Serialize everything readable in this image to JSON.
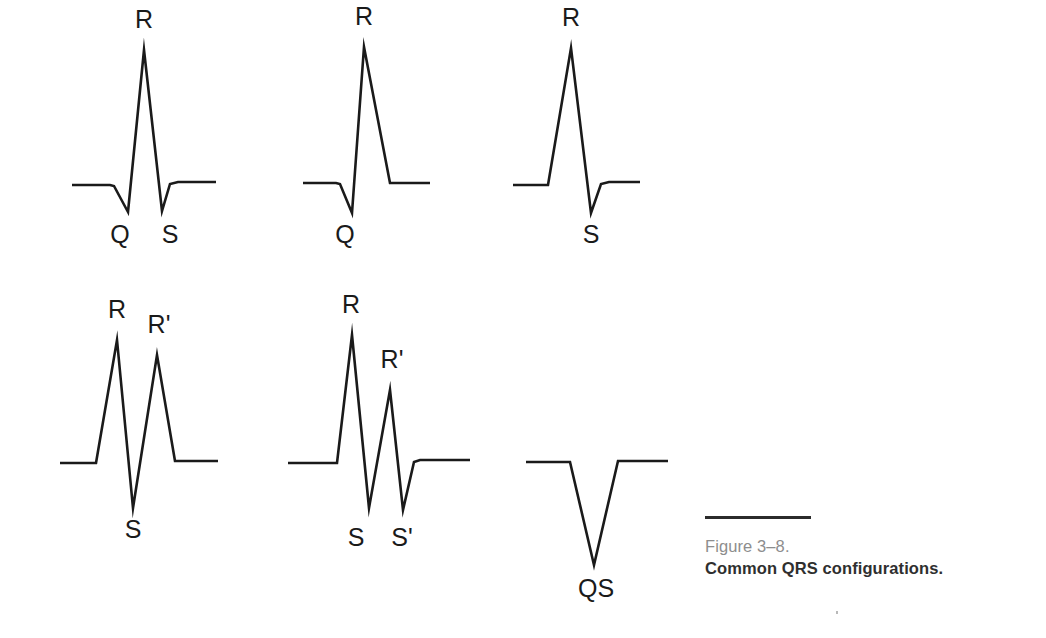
{
  "figure": {
    "number": "Figure 3–8.",
    "title": "Common QRS configurations.",
    "stroke_color": "#1a1a1a",
    "label_color": "#1a1a1a",
    "number_color": "#8d8d8d",
    "title_color": "#2f2f2f",
    "background_color": "#ffffff",
    "width": 1046,
    "height": 638
  },
  "chart_data": {
    "type": "line",
    "title": "Common QRS configurations.",
    "xlabel": "",
    "ylabel": "",
    "grid": false,
    "legend": "none",
    "series": [
      {
        "name": "qRs",
        "row": 1,
        "column": 1,
        "baseline_y": 185,
        "points": [
          [
            72,
            185
          ],
          [
            110,
            185
          ],
          [
            114,
            186
          ],
          [
            128,
            212
          ],
          [
            144,
            50
          ],
          [
            162,
            211
          ],
          [
            170,
            184
          ],
          [
            178,
            182
          ],
          [
            216,
            182
          ]
        ],
        "deflections": [
          {
            "label": "Q",
            "polarity": "negative",
            "apex": [
              128,
              212
            ]
          },
          {
            "label": "R",
            "polarity": "positive",
            "apex": [
              144,
              50
            ]
          },
          {
            "label": "S",
            "polarity": "negative",
            "apex": [
              162,
              211
            ]
          }
        ]
      },
      {
        "name": "qR",
        "row": 1,
        "column": 2,
        "baseline_y": 185,
        "points": [
          [
            303,
            183
          ],
          [
            336,
            183
          ],
          [
            340,
            184
          ],
          [
            352,
            213
          ],
          [
            364,
            47
          ],
          [
            390,
            183
          ],
          [
            430,
            183
          ]
        ],
        "deflections": [
          {
            "label": "Q",
            "polarity": "negative",
            "apex": [
              352,
              213
            ]
          },
          {
            "label": "R",
            "polarity": "positive",
            "apex": [
              364,
              47
            ]
          }
        ]
      },
      {
        "name": "Rs",
        "row": 1,
        "column": 3,
        "baseline_y": 185,
        "points": [
          [
            513,
            185
          ],
          [
            548,
            185
          ],
          [
            571,
            48
          ],
          [
            591,
            213
          ],
          [
            601,
            184
          ],
          [
            609,
            182
          ],
          [
            640,
            182
          ]
        ],
        "deflections": [
          {
            "label": "R",
            "polarity": "positive",
            "apex": [
              571,
              48
            ]
          },
          {
            "label": "S",
            "polarity": "negative",
            "apex": [
              591,
              213
            ]
          }
        ]
      },
      {
        "name": "RSR'",
        "row": 2,
        "column": 1,
        "baseline_y": 462,
        "points": [
          [
            60,
            463
          ],
          [
            96,
            463
          ],
          [
            117,
            340
          ],
          [
            133,
            508
          ],
          [
            157,
            355
          ],
          [
            175,
            461
          ],
          [
            218,
            461
          ]
        ],
        "deflections": [
          {
            "label": "R",
            "polarity": "positive",
            "apex": [
              117,
              340
            ]
          },
          {
            "label": "S",
            "polarity": "negative",
            "apex": [
              133,
              508
            ]
          },
          {
            "label": "R'",
            "polarity": "positive",
            "apex": [
              157,
              355
            ]
          }
        ]
      },
      {
        "name": "RSR'S'",
        "row": 2,
        "column": 2,
        "baseline_y": 462,
        "points": [
          [
            288,
            463
          ],
          [
            337,
            463
          ],
          [
            352,
            335
          ],
          [
            369,
            508
          ],
          [
            390,
            390
          ],
          [
            403,
            510
          ],
          [
            414,
            462
          ],
          [
            420,
            460
          ],
          [
            470,
            460
          ]
        ],
        "deflections": [
          {
            "label": "R",
            "polarity": "positive",
            "apex": [
              352,
              335
            ]
          },
          {
            "label": "S",
            "polarity": "negative",
            "apex": [
              369,
              508
            ]
          },
          {
            "label": "R'",
            "polarity": "positive",
            "apex": [
              390,
              390
            ]
          },
          {
            "label": "S'",
            "polarity": "negative",
            "apex": [
              403,
              510
            ]
          }
        ]
      },
      {
        "name": "QS",
        "row": 2,
        "column": 3,
        "baseline_y": 462,
        "points": [
          [
            526,
            462
          ],
          [
            570,
            462
          ],
          [
            594,
            565
          ],
          [
            618,
            461
          ],
          [
            668,
            461
          ]
        ],
        "deflections": [
          {
            "label": "QS",
            "polarity": "negative",
            "apex": [
              594,
              565
            ]
          }
        ]
      }
    ],
    "annotations": [
      {
        "text": "R",
        "x": 144,
        "y": 28,
        "complex": "qRs"
      },
      {
        "text": "Q",
        "x": 120,
        "y": 243,
        "complex": "qRs"
      },
      {
        "text": "S",
        "x": 170,
        "y": 243,
        "complex": "qRs"
      },
      {
        "text": "R",
        "x": 364,
        "y": 25,
        "complex": "qR"
      },
      {
        "text": "Q",
        "x": 345,
        "y": 243,
        "complex": "qR"
      },
      {
        "text": "R",
        "x": 571,
        "y": 26,
        "complex": "Rs"
      },
      {
        "text": "S",
        "x": 591,
        "y": 243,
        "complex": "Rs"
      },
      {
        "text": "R",
        "x": 117,
        "y": 318,
        "complex": "RSR'"
      },
      {
        "text": "R'",
        "x": 159,
        "y": 333,
        "complex": "RSR'"
      },
      {
        "text": "S",
        "x": 133,
        "y": 538,
        "complex": "RSR'"
      },
      {
        "text": "R",
        "x": 351,
        "y": 313,
        "complex": "RSR'S'"
      },
      {
        "text": "R'",
        "x": 392,
        "y": 368,
        "complex": "RSR'S'"
      },
      {
        "text": "S",
        "x": 356,
        "y": 546,
        "complex": "RSR'S'"
      },
      {
        "text": "S'",
        "x": 402,
        "y": 546,
        "complex": "RSR'S'"
      },
      {
        "text": "QS",
        "x": 596,
        "y": 597,
        "complex": "QS"
      }
    ]
  }
}
